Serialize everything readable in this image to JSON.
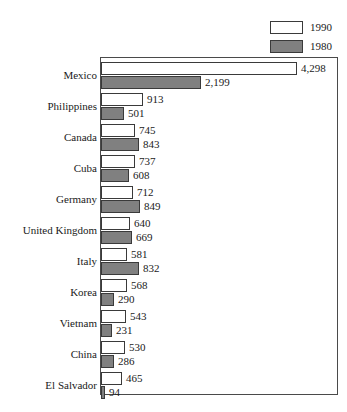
{
  "legend": {
    "position": "top-right",
    "entries": [
      {
        "label": "1990",
        "swatch": "white-swatch",
        "color": "#ffffff"
      },
      {
        "label": "1980",
        "swatch": "gray-swatch",
        "color": "#808080"
      }
    ]
  },
  "chart_data": {
    "type": "bar",
    "orientation": "horizontal",
    "title": "",
    "subtitle": "",
    "xlabel": "",
    "ylabel": "",
    "grid": false,
    "legend_position": "top-right",
    "xlim": [
      0,
      4298
    ],
    "categories": [
      "Mexico",
      "Philippines",
      "Canada",
      "Cuba",
      "Germany",
      "United Kingdom",
      "Italy",
      "Korea",
      "Vietnam",
      "China",
      "El Salvador"
    ],
    "series": [
      {
        "name": "1990",
        "color": "#ffffff",
        "values": [
          4298,
          913,
          745,
          737,
          712,
          640,
          581,
          568,
          543,
          530,
          465
        ],
        "labels": [
          "4,298",
          "913",
          "745",
          "737",
          "712",
          "640",
          "581",
          "568",
          "543",
          "530",
          "465"
        ]
      },
      {
        "name": "1980",
        "color": "#808080",
        "values": [
          2199,
          501,
          843,
          608,
          849,
          669,
          832,
          290,
          231,
          286,
          94
        ],
        "labels": [
          "2,199",
          "501",
          "843",
          "608",
          "849",
          "669",
          "832",
          "290",
          "231",
          "286",
          "94"
        ]
      }
    ]
  }
}
